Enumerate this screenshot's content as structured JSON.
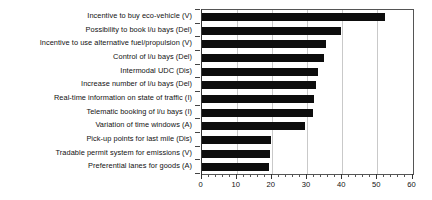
{
  "chart_data": {
    "type": "bar",
    "orientation": "horizontal",
    "title": "",
    "subtitle": "",
    "xlabel": "",
    "ylabel": "",
    "xlim": [
      0,
      60
    ],
    "ylim": null,
    "xticks": [
      0,
      10,
      20,
      30,
      40,
      50,
      60
    ],
    "xtick_labels": [
      "0",
      "10",
      "20",
      "30",
      "40",
      "50",
      "60"
    ],
    "minor_tick_step": 2,
    "grid": true,
    "grid_axis": "x",
    "legend": null,
    "bar_color": "#0d0d0d",
    "categories": [
      "Incentive to buy eco-vehicle (V)",
      "Possibility to book l/u bays (Del)",
      "Incentive to use alternative fuel/propulsion (V)",
      "Control of l/u bays (Del)",
      "Intermodal UDC (Dis)",
      "Increase number of l/u bays (Del)",
      "Real-time information on state of traffic (I)",
      "Telematic booking of l/u bays (I)",
      "Variation of time windows (A)",
      "Pick-up points for last mile (Dis)",
      "Tradable permit system for emissions (V)",
      "Preferential lanes for goods (A)"
    ],
    "values": [
      52.3,
      39.7,
      35.4,
      34.9,
      33.0,
      32.7,
      31.9,
      31.8,
      29.5,
      19.8,
      19.5,
      19.3
    ]
  }
}
